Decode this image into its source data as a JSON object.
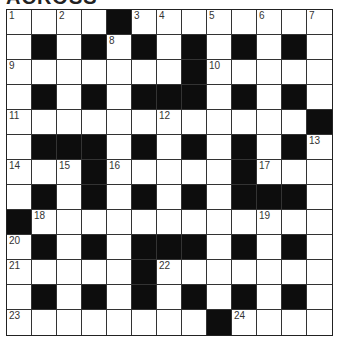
{
  "title": "ACROSS",
  "grid": {
    "rows": 13,
    "cols": 13,
    "layout": [
      "....#........",
      ".#.#.#.#.#.#.",
      ".......#.....",
      ".#.#.###.#.#.",
      "............#",
      ".###.#.#.#.#.",
      "...#.....#...",
      ".#.#.#.#.###.",
      "#............",
      ".#.#.###.#.#.",
      ".....#.......",
      ".#.#.#.#.#.#.",
      "........#...."
    ],
    "numbers": [
      {
        "row": 0,
        "col": 0,
        "n": "1"
      },
      {
        "row": 0,
        "col": 2,
        "n": "2"
      },
      {
        "row": 0,
        "col": 5,
        "n": "3"
      },
      {
        "row": 0,
        "col": 6,
        "n": "4"
      },
      {
        "row": 0,
        "col": 8,
        "n": "5"
      },
      {
        "row": 0,
        "col": 10,
        "n": "6"
      },
      {
        "row": 0,
        "col": 12,
        "n": "7"
      },
      {
        "row": 1,
        "col": 4,
        "n": "8"
      },
      {
        "row": 2,
        "col": 0,
        "n": "9"
      },
      {
        "row": 2,
        "col": 8,
        "n": "10"
      },
      {
        "row": 4,
        "col": 0,
        "n": "11"
      },
      {
        "row": 4,
        "col": 6,
        "n": "12"
      },
      {
        "row": 5,
        "col": 12,
        "n": "13"
      },
      {
        "row": 6,
        "col": 0,
        "n": "14"
      },
      {
        "row": 6,
        "col": 2,
        "n": "15"
      },
      {
        "row": 6,
        "col": 4,
        "n": "16"
      },
      {
        "row": 6,
        "col": 10,
        "n": "17"
      },
      {
        "row": 8,
        "col": 1,
        "n": "18"
      },
      {
        "row": 8,
        "col": 10,
        "n": "19"
      },
      {
        "row": 9,
        "col": 0,
        "n": "20"
      },
      {
        "row": 10,
        "col": 0,
        "n": "21"
      },
      {
        "row": 10,
        "col": 6,
        "n": "22"
      },
      {
        "row": 12,
        "col": 0,
        "n": "23"
      },
      {
        "row": 12,
        "col": 9,
        "n": "24"
      }
    ]
  },
  "colors": {
    "block": "#0d0d0d",
    "cell": "#ffffff",
    "line": "#333333"
  }
}
